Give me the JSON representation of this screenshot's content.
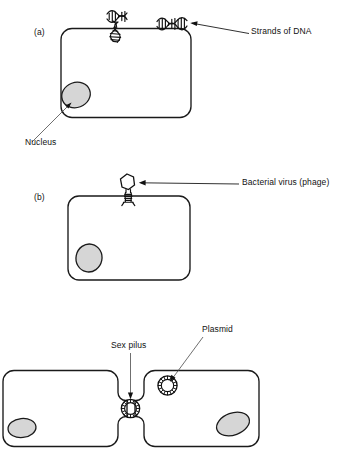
{
  "figure": {
    "type": "biology-diagram",
    "background_color": "#ffffff",
    "line_color": "#1a1a1a",
    "nucleus_fill": "#d6d6d6",
    "leader_color": "#4a4a4a"
  },
  "panels": [
    {
      "id": "a",
      "tag": "(a)",
      "process": "transformation",
      "labels": [
        {
          "name": "strands-of-dna",
          "text": "Strands of DNA"
        },
        {
          "name": "nucleus",
          "text": "Nucleus"
        }
      ],
      "elements": [
        {
          "name": "bacterial-cell",
          "kind": "rounded-rect"
        },
        {
          "name": "nucleus-blob",
          "kind": "ellipse",
          "fill": "#d6d6d6"
        },
        {
          "name": "dna-strand-free",
          "kind": "helix"
        },
        {
          "name": "dna-strand-entering",
          "kind": "helix"
        },
        {
          "name": "dna-strand-labelled",
          "kind": "helix"
        }
      ]
    },
    {
      "id": "b",
      "tag": "(b)",
      "process": "transduction",
      "labels": [
        {
          "name": "bacterial-virus-phage",
          "text": "Bacterial virus (phage)"
        }
      ],
      "elements": [
        {
          "name": "bacterial-cell",
          "kind": "rounded-rect"
        },
        {
          "name": "nucleus-blob",
          "kind": "ellipse",
          "fill": "#d6d6d6"
        },
        {
          "name": "phage-particle",
          "kind": "hexagon-head-with-tail"
        }
      ]
    },
    {
      "id": "c",
      "tag": "",
      "process": "conjugation",
      "labels": [
        {
          "name": "sex-pilus",
          "text": "Sex pilus"
        },
        {
          "name": "plasmid",
          "text": "Plasmid"
        }
      ],
      "elements": [
        {
          "name": "donor-cell-left",
          "kind": "rounded-rect"
        },
        {
          "name": "recipient-cell-right",
          "kind": "rounded-rect"
        },
        {
          "name": "nucleus-blob-left",
          "kind": "ellipse",
          "fill": "#d6d6d6"
        },
        {
          "name": "nucleus-blob-right",
          "kind": "ellipse",
          "fill": "#d6d6d6"
        },
        {
          "name": "plasmid-ring",
          "kind": "annulus"
        },
        {
          "name": "sex-pilus-ring",
          "kind": "annulus"
        }
      ]
    }
  ],
  "text": {
    "panel_a_tag": "(a)",
    "panel_b_tag": "(b)",
    "strands_of_dna": "Strands of DNA",
    "nucleus": "Nucleus",
    "bacterial_virus_phage": "Bacterial virus (phage)",
    "sex_pilus": "Sex pilus",
    "plasmid": "Plasmid"
  }
}
